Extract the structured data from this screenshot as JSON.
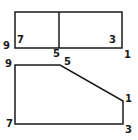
{
  "colors": {
    "stroke": "#1a1a1a",
    "background": "#ffffff"
  },
  "top_view": {
    "labels": [
      {
        "text": "9",
        "x": 3,
        "y": 45
      },
      {
        "text": "7",
        "x": 16,
        "y": 38
      },
      {
        "text": "5",
        "x": 54,
        "y": 49
      },
      {
        "text": "3",
        "x": 109,
        "y": 38
      },
      {
        "text": "1",
        "x": 124,
        "y": 50
      }
    ]
  },
  "front_view": {
    "labels": [
      {
        "text": "9",
        "x": 5,
        "y": 60
      },
      {
        "text": "5",
        "x": 64,
        "y": 60
      },
      {
        "text": "1",
        "x": 125,
        "y": 96
      },
      {
        "text": "7",
        "x": 6,
        "y": 120
      },
      {
        "text": "3",
        "x": 125,
        "y": 124
      }
    ]
  }
}
